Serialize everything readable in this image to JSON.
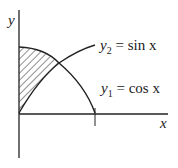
{
  "diagram": {
    "axes": {
      "x_label": "x",
      "y_label": "y"
    },
    "curves": [
      {
        "name": "y1",
        "label_var": "y",
        "label_sub": "1",
        "label_eq": "= cos x"
      },
      {
        "name": "y2",
        "label_var": "y",
        "label_sub": "2",
        "label_eq": "= sin x"
      }
    ],
    "shaded_region": "between y1 = cos x and y2 = sin x from x = 0 to intersection",
    "colors": {
      "stroke": "#222222",
      "background": "#ffffff"
    }
  }
}
